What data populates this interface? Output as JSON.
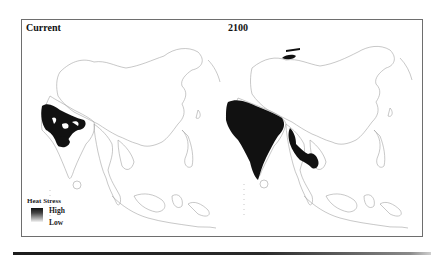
{
  "figure": {
    "panels": [
      {
        "id": "current",
        "title": "Current"
      },
      {
        "id": "future",
        "title": "2100"
      }
    ],
    "legend": {
      "title": "Heat Stress",
      "high_label": "High",
      "low_label": "Low"
    },
    "colors": {
      "high": "#111111",
      "low": "#f4f4f4",
      "outline": "#9a9a9a",
      "frame": "#6e6e6e"
    }
  }
}
